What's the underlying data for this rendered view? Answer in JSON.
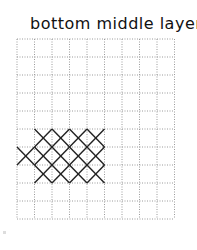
{
  "title": "bottom middle layer",
  "grid": {
    "columns": 9,
    "rows": 10,
    "origin_x": 17,
    "origin_y": 39,
    "cell_w": 17.5,
    "cell_h": 18,
    "line_color": "#9a9a9a",
    "cross_color": "#222222"
  },
  "crosses": [
    {
      "col": 1,
      "row": 5
    },
    {
      "col": 2,
      "row": 5
    },
    {
      "col": 3,
      "row": 5
    },
    {
      "col": 4,
      "row": 5
    },
    {
      "col": 0,
      "row": 6
    },
    {
      "col": 1,
      "row": 6
    },
    {
      "col": 2,
      "row": 6
    },
    {
      "col": 3,
      "row": 6
    },
    {
      "col": 4,
      "row": 6
    },
    {
      "col": 1,
      "row": 7
    },
    {
      "col": 2,
      "row": 7
    },
    {
      "col": 3,
      "row": 7
    },
    {
      "col": 4,
      "row": 7
    }
  ]
}
